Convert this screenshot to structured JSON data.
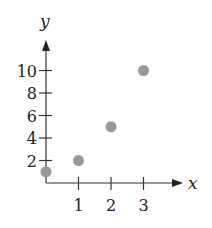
{
  "chart_data": {
    "type": "scatter",
    "title": "",
    "xlabel": "x",
    "ylabel": "y",
    "x": [
      0,
      1,
      2,
      3
    ],
    "y": [
      1,
      2,
      5,
      10
    ],
    "series": [
      {
        "name": "points",
        "points": [
          {
            "x": 0,
            "y": 1
          },
          {
            "x": 1,
            "y": 2
          },
          {
            "x": 2,
            "y": 5
          },
          {
            "x": 3,
            "y": 10
          }
        ]
      }
    ],
    "xticks": [
      1,
      2,
      3
    ],
    "xtick_labels": [
      "1",
      "2",
      "3"
    ],
    "yticks": [
      2,
      4,
      6,
      8,
      10
    ],
    "ytick_labels": [
      "2",
      "4",
      "6",
      "8",
      "10"
    ],
    "xlim": [
      0,
      4.2
    ],
    "ylim": [
      0,
      13
    ],
    "grid": false,
    "legend": null,
    "point_color": "#999999",
    "axis_color": "#333333"
  }
}
